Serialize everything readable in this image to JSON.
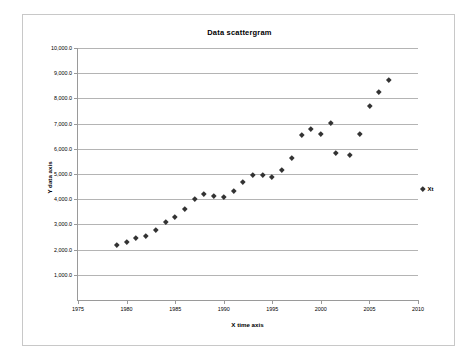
{
  "chart_data": {
    "type": "scatter",
    "title": "Data scattergram",
    "xlabel": "X time axis",
    "ylabel": "Y data axis",
    "xlim": [
      1975,
      2010
    ],
    "ylim": [
      0,
      10000
    ],
    "grid": true,
    "legend_position": "right",
    "series": [
      {
        "name": "Xt",
        "marker": "diamond",
        "color": "#333333",
        "points": [
          {
            "x": 1979.0,
            "y": 2200
          },
          {
            "x": 1980.0,
            "y": 2300
          },
          {
            "x": 1981.0,
            "y": 2450
          },
          {
            "x": 1982.0,
            "y": 2550
          },
          {
            "x": 1983.0,
            "y": 2800
          },
          {
            "x": 1984.0,
            "y": 3100
          },
          {
            "x": 1985.0,
            "y": 3300
          },
          {
            "x": 1986.0,
            "y": 3600
          },
          {
            "x": 1987.0,
            "y": 4000
          },
          {
            "x": 1988.0,
            "y": 4200
          },
          {
            "x": 1989.0,
            "y": 4150
          },
          {
            "x": 1990.0,
            "y": 4100
          },
          {
            "x": 1991.0,
            "y": 4350
          },
          {
            "x": 1992.0,
            "y": 4700
          },
          {
            "x": 1993.0,
            "y": 4950
          },
          {
            "x": 1994.0,
            "y": 4950
          },
          {
            "x": 1995.0,
            "y": 4900
          },
          {
            "x": 1996.0,
            "y": 5150
          },
          {
            "x": 1997.0,
            "y": 5650
          },
          {
            "x": 1998.0,
            "y": 6550
          },
          {
            "x": 1999.0,
            "y": 6800
          },
          {
            "x": 2000.0,
            "y": 6600
          },
          {
            "x": 2001.0,
            "y": 7050
          },
          {
            "x": 2001.5,
            "y": 5850
          },
          {
            "x": 2003.0,
            "y": 5750
          },
          {
            "x": 2004.0,
            "y": 6600
          },
          {
            "x": 2005.0,
            "y": 7700
          },
          {
            "x": 2006.0,
            "y": 8250
          },
          {
            "x": 2007.0,
            "y": 8750
          }
        ]
      }
    ],
    "ytick_values": [
      1000,
      2000,
      3000,
      4000,
      5000,
      6000,
      7000,
      8000,
      9000,
      10000
    ],
    "ytick_labels": [
      "1,000.0",
      "2,000.0",
      "3,000.0",
      "4,000.0",
      "5,000.0",
      "6,000.0",
      "7,000.0",
      "8,000.0",
      "9,000.0",
      "10,000.0"
    ],
    "xtick_values": [
      1975,
      1980,
      1985,
      1990,
      1995,
      2000,
      2005,
      2010
    ],
    "xtick_labels": [
      "1975",
      "1980",
      "1985",
      "1990",
      "1995",
      "2000",
      "2005",
      "2010"
    ]
  },
  "legend": {
    "entries": [
      {
        "label": "Xt",
        "marker": "diamond",
        "color": "#333333"
      }
    ]
  },
  "colors": {
    "marker": "#333333",
    "gridline": "#b4b4b4",
    "axis": "#9a9a9a",
    "frame": "#c8c8c8",
    "background": "#ffffff"
  }
}
